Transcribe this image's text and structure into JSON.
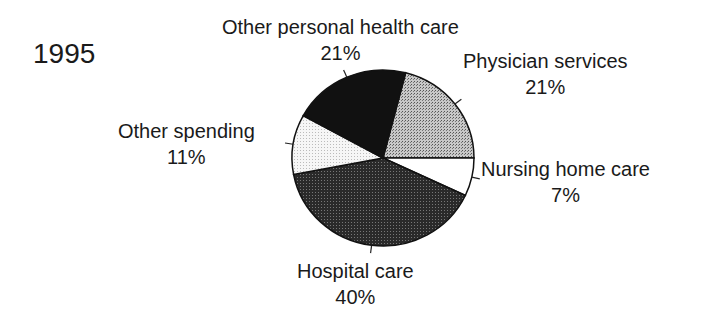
{
  "chart_data": {
    "type": "pie",
    "title": "1995",
    "categories": [
      "Physician services",
      "Nursing home care",
      "Hospital care",
      "Other spending",
      "Other personal health care"
    ],
    "values": [
      21,
      7,
      40,
      11,
      21
    ],
    "unit": "%",
    "fills": [
      "#a8a8a8",
      "#ffffff",
      "#3a3a3a",
      "#eeeeee",
      "#111111"
    ],
    "labels": [
      {
        "name": "Physician services",
        "pct": "21%"
      },
      {
        "name": "Nursing home care",
        "pct": "7%"
      },
      {
        "name": "Hospital care",
        "pct": "40%"
      },
      {
        "name": "Other spending",
        "pct": "11%"
      },
      {
        "name": "Other personal health care",
        "pct": "21%"
      }
    ]
  }
}
